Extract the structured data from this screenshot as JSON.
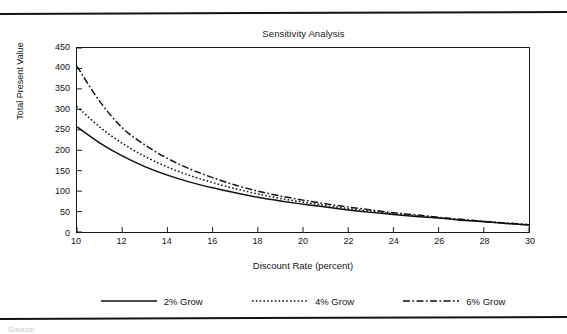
{
  "figure": {
    "top_rule": "horizontal-rule",
    "bottom_rule": "horizontal-rule",
    "source_caption": "Source:"
  },
  "chart_data": {
    "type": "line",
    "title": "Sensitivity Analysis",
    "xlabel": "Discount Rate (percent)",
    "ylabel": "Total Present Value",
    "xlim": [
      10,
      30
    ],
    "ylim": [
      0,
      450
    ],
    "xticks": [
      10,
      12,
      14,
      16,
      18,
      20,
      22,
      24,
      26,
      28,
      30
    ],
    "yticks": [
      0,
      50,
      100,
      150,
      200,
      250,
      300,
      350,
      400,
      450
    ],
    "grid": false,
    "legend_position": "bottom",
    "x": [
      10,
      11,
      12,
      13,
      14,
      15,
      16,
      17,
      18,
      19,
      20,
      21,
      22,
      23,
      24,
      25,
      26,
      27,
      28,
      29,
      30
    ],
    "series": [
      {
        "name": "2% Grow",
        "style": "solid",
        "color": "#111111",
        "values": [
          257,
          218,
          186,
          160,
          139,
          122,
          108,
          96,
          85,
          76,
          68,
          61,
          54,
          48,
          43,
          38,
          34,
          29,
          25,
          21,
          17
        ]
      },
      {
        "name": "4% Grow",
        "style": "dotted",
        "color": "#111111",
        "values": [
          307,
          257,
          217,
          185,
          159,
          138,
          121,
          106,
          93,
          82,
          73,
          65,
          57,
          51,
          45,
          40,
          35,
          30,
          26,
          21,
          17
        ]
      },
      {
        "name": "6% Grow",
        "style": "dash-dot",
        "color": "#111111",
        "values": [
          405,
          320,
          255,
          213,
          180,
          154,
          133,
          115,
          100,
          88,
          78,
          69,
          61,
          54,
          47,
          42,
          36,
          31,
          26,
          22,
          18
        ]
      }
    ]
  },
  "legend": {
    "items": [
      {
        "label": "2% Grow",
        "swatch": "solid-line-swatch"
      },
      {
        "label": "4% Grow",
        "swatch": "dotted-line-swatch"
      },
      {
        "label": "6% Grow",
        "swatch": "dash-dot-line-swatch"
      }
    ]
  }
}
